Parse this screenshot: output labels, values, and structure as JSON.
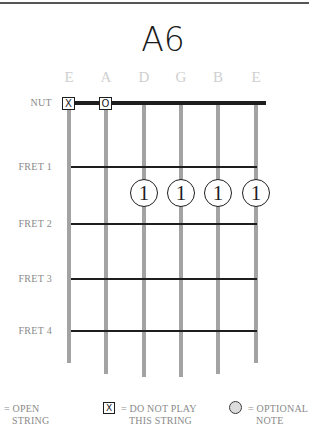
{
  "chord": {
    "name": "A6"
  },
  "strings": [
    {
      "label": "E",
      "x": 69,
      "bottom": 363,
      "marker": "x"
    },
    {
      "label": "A",
      "x": 106,
      "bottom": 374,
      "marker": "o"
    },
    {
      "label": "D",
      "x": 144,
      "bottom": 377,
      "marker": ""
    },
    {
      "label": "G",
      "x": 181,
      "bottom": 377,
      "marker": ""
    },
    {
      "label": "B",
      "x": 218,
      "bottom": 374,
      "marker": ""
    },
    {
      "label": "E",
      "x": 256,
      "bottom": 363,
      "marker": ""
    }
  ],
  "nut": {
    "label": "NUT"
  },
  "frets": [
    {
      "label": "FRET 1",
      "y": 167
    },
    {
      "label": "FRET 2",
      "y": 224
    },
    {
      "label": "FRET 3",
      "y": 279
    },
    {
      "label": "FRET 4",
      "y": 331
    }
  ],
  "markers": {
    "muted_symbol": "X",
    "open_symbol": "O"
  },
  "fingerings": [
    {
      "string": "D",
      "fret": 2,
      "finger": "1"
    },
    {
      "string": "G",
      "fret": 2,
      "finger": "1"
    },
    {
      "string": "B",
      "fret": 2,
      "finger": "1"
    },
    {
      "string": "E",
      "fret": 2,
      "finger": "1"
    }
  ],
  "legend": {
    "open": {
      "line1": "= OPEN",
      "line2": "STRING"
    },
    "muted": {
      "symbol": "X",
      "line1": "= DO NOT PLAY",
      "line2": "THIS STRING"
    },
    "optional": {
      "line1": "= OPTIONAL",
      "line2": "NOTE"
    }
  },
  "colors": {
    "ink": "#1e1e1e",
    "string": "#a3a3a3",
    "string_label": "#cfcfcf",
    "side_label": "#8a8a8a",
    "optional_fill": "#dcdcdc"
  }
}
